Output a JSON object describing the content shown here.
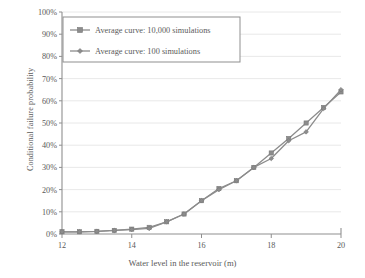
{
  "chart_data": {
    "type": "line",
    "title": "",
    "xlabel": "Water level in the reservoir (m)",
    "ylabel": "Conditional failure probability",
    "xlim": [
      12,
      20
    ],
    "ylim": [
      0,
      100
    ],
    "grid": "horizontal",
    "legend_position": "top-left-inside",
    "x_ticks": [
      "12",
      "14",
      "16",
      "18",
      "20"
    ],
    "x_tick_values": [
      12,
      14,
      16,
      18,
      20
    ],
    "y_ticks": [
      "0%",
      "10%",
      "20%",
      "30%",
      "40%",
      "50%",
      "60%",
      "70%",
      "80%",
      "90%",
      "100%"
    ],
    "y_tick_values": [
      0,
      10,
      20,
      30,
      40,
      50,
      60,
      70,
      80,
      90,
      100
    ],
    "x": [
      12,
      12.5,
      13,
      13.5,
      14,
      14.5,
      15,
      15.5,
      16,
      16.5,
      17,
      17.5,
      18,
      18.5,
      19,
      19.5,
      20
    ],
    "series": [
      {
        "name": "Average curve: 10,000 simulations",
        "marker": "square",
        "color": "#8c8c8c",
        "values": [
          1,
          1,
          1.2,
          1.6,
          2.2,
          3,
          5.5,
          9,
          15,
          20.5,
          24,
          30,
          36.5,
          43,
          50,
          57,
          64
        ]
      },
      {
        "name": "Average curve: 100 simulations",
        "marker": "diamond",
        "color": "#8c8c8c",
        "values": [
          1,
          1,
          1.2,
          1.6,
          2,
          2.5,
          5.5,
          9,
          15,
          20,
          24,
          30,
          34,
          42,
          46,
          56.5,
          65
        ]
      }
    ]
  },
  "legend": {
    "entries": [
      {
        "label": "Average curve: 10,000 simulations",
        "marker": "square-marker-icon"
      },
      {
        "label": "Average curve: 100 simulations",
        "marker": "diamond-marker-icon"
      }
    ]
  },
  "colors": {
    "line": "#8c8c8c",
    "axis": "#8f8f8f",
    "grid": "#e2e2e2",
    "text": "#5a5a5a",
    "background": "#ffffff"
  }
}
